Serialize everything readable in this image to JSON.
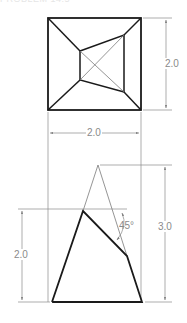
{
  "title_fragment": "PROBLEM 14.5",
  "top_view": {
    "name": "top view",
    "outer_square": {
      "x1": 48,
      "y1": 18,
      "x2": 141,
      "y2": 110
    },
    "inner_quad": [
      [
        80,
        51
      ],
      [
        124,
        35
      ],
      [
        124,
        92
      ],
      [
        80,
        80
      ]
    ]
  },
  "front_view": {
    "name": "front view",
    "base": {
      "x1": 52,
      "x2": 142,
      "y": 302
    },
    "apex": [
      98,
      165
    ],
    "cut_top": [
      83,
      211
    ],
    "cut_right": [
      127,
      256
    ]
  },
  "dimensions": {
    "top_height": "2.0",
    "top_width": "2.0",
    "front_height_total": "3.0",
    "front_height_cut": "2.0",
    "cut_angle": "45°"
  },
  "colors": {
    "object_line": "#1a1a1a",
    "thin_line": "#7a7a7a",
    "dim_text": "#8a8a8a"
  }
}
